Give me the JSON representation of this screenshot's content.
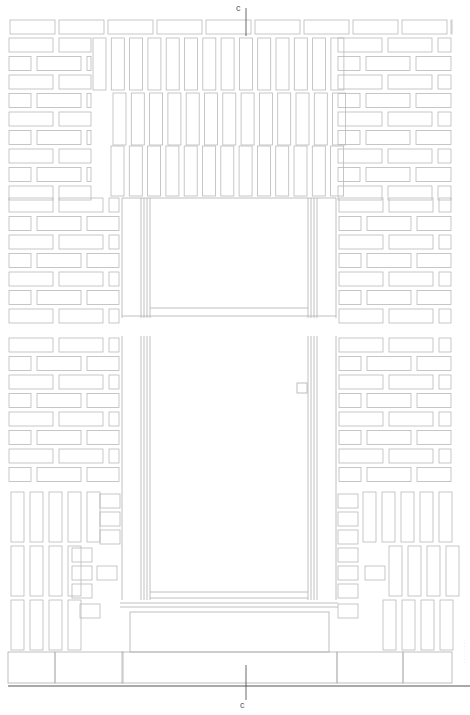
{
  "drawing": {
    "type": "architectural elevation",
    "subject": "brick facade with door opening",
    "line_color": "#b9b9b9",
    "ground_line_color": "#555555",
    "section_marker_top": "c",
    "section_marker_bottom": "c",
    "side_note": "· · · · · · · ·"
  },
  "layout": {
    "wall_left": 8,
    "wall_right": 452,
    "top": 20,
    "ground_y": 688,
    "door": {
      "outer_left": 122,
      "outer_right": 336,
      "inner_left": 150,
      "inner_right": 308,
      "top": 198,
      "sill_y": 600
    },
    "break_y": [
      318,
      336
    ],
    "step": {
      "left": 122,
      "right": 337,
      "top": 612,
      "mid": 652,
      "bottom": 683
    },
    "section_line_x": 246
  }
}
